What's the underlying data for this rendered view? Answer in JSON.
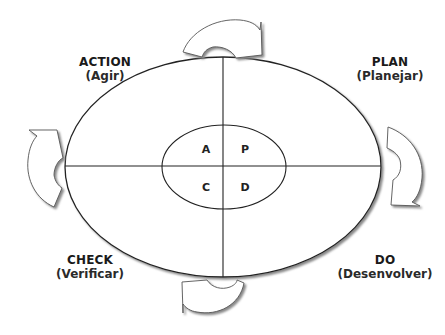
{
  "diagram": {
    "type": "PDCA cycle",
    "quadrants": [
      {
        "id": "action",
        "name": "ACTION",
        "translation": "(Agir)",
        "letter": "A",
        "position": "top-left"
      },
      {
        "id": "plan",
        "name": "PLAN",
        "translation": "(Planejar)",
        "letter": "P",
        "position": "top-right"
      },
      {
        "id": "check",
        "name": "CHECK",
        "translation": "(Verificar)",
        "letter": "C",
        "position": "bottom-left"
      },
      {
        "id": "do",
        "name": "DO",
        "translation": "(Desenvolver)",
        "letter": "D",
        "position": "bottom-right"
      }
    ],
    "arrows": [
      {
        "position": "top",
        "direction": "clockwise"
      },
      {
        "position": "right",
        "direction": "clockwise"
      },
      {
        "position": "bottom",
        "direction": "clockwise"
      },
      {
        "position": "left",
        "direction": "clockwise"
      }
    ],
    "colors": {
      "stroke": "#222222",
      "shadow": "#999999",
      "fill": "#ffffff"
    }
  }
}
